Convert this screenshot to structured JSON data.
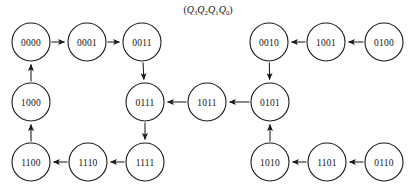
{
  "diagram": {
    "caption": "(Q3Q2Q1Q0)",
    "caption_parts": {
      "open": "(",
      "close": ")",
      "vars": [
        {
          "name": "Q",
          "sub": "3"
        },
        {
          "name": "Q",
          "sub": "2"
        },
        {
          "name": "Q",
          "sub": "1"
        },
        {
          "name": "Q",
          "sub": "0"
        }
      ]
    },
    "colors": {
      "background": "#ffffff",
      "node_stroke": "#1a1a1a",
      "node_fill": "#ffffff",
      "edge": "#1a1a1a",
      "text": "#111111"
    },
    "node_radius": 19,
    "nodes": [
      {
        "id": "0000",
        "label": "0000",
        "x": 31,
        "y": 42
      },
      {
        "id": "0001",
        "label": "0001",
        "x": 87,
        "y": 42
      },
      {
        "id": "0011",
        "label": "0011",
        "x": 142,
        "y": 42
      },
      {
        "id": "0010",
        "label": "0010",
        "x": 269,
        "y": 42
      },
      {
        "id": "1001",
        "label": "1001",
        "x": 326,
        "y": 42
      },
      {
        "id": "0100",
        "label": "0100",
        "x": 384,
        "y": 42
      },
      {
        "id": "1000",
        "label": "1000",
        "x": 31,
        "y": 102
      },
      {
        "id": "0111",
        "label": "0111",
        "x": 145,
        "y": 102
      },
      {
        "id": "1011",
        "label": "1011",
        "x": 207,
        "y": 102
      },
      {
        "id": "0101",
        "label": "0101",
        "x": 270,
        "y": 102
      },
      {
        "id": "1100",
        "label": "1100",
        "x": 31,
        "y": 162
      },
      {
        "id": "1110",
        "label": "1110",
        "x": 88,
        "y": 162
      },
      {
        "id": "1111",
        "label": "1111",
        "x": 145,
        "y": 162
      },
      {
        "id": "1010",
        "label": "1010",
        "x": 270,
        "y": 162
      },
      {
        "id": "1101",
        "label": "1101",
        "x": 327,
        "y": 162
      },
      {
        "id": "0110",
        "label": "0110",
        "x": 384,
        "y": 162
      }
    ],
    "edges": [
      {
        "from": "0000",
        "to": "0001"
      },
      {
        "from": "0001",
        "to": "0011"
      },
      {
        "from": "0011",
        "to": "0111"
      },
      {
        "from": "0111",
        "to": "1111"
      },
      {
        "from": "1111",
        "to": "1110"
      },
      {
        "from": "1110",
        "to": "1100"
      },
      {
        "from": "1100",
        "to": "1000"
      },
      {
        "from": "1000",
        "to": "0000"
      },
      {
        "from": "0100",
        "to": "1001"
      },
      {
        "from": "1001",
        "to": "0010"
      },
      {
        "from": "0010",
        "to": "0101"
      },
      {
        "from": "0101",
        "to": "1011"
      },
      {
        "from": "1011",
        "to": "0111"
      },
      {
        "from": "0110",
        "to": "1101"
      },
      {
        "from": "1101",
        "to": "1010"
      },
      {
        "from": "1010",
        "to": "0101"
      }
    ]
  }
}
